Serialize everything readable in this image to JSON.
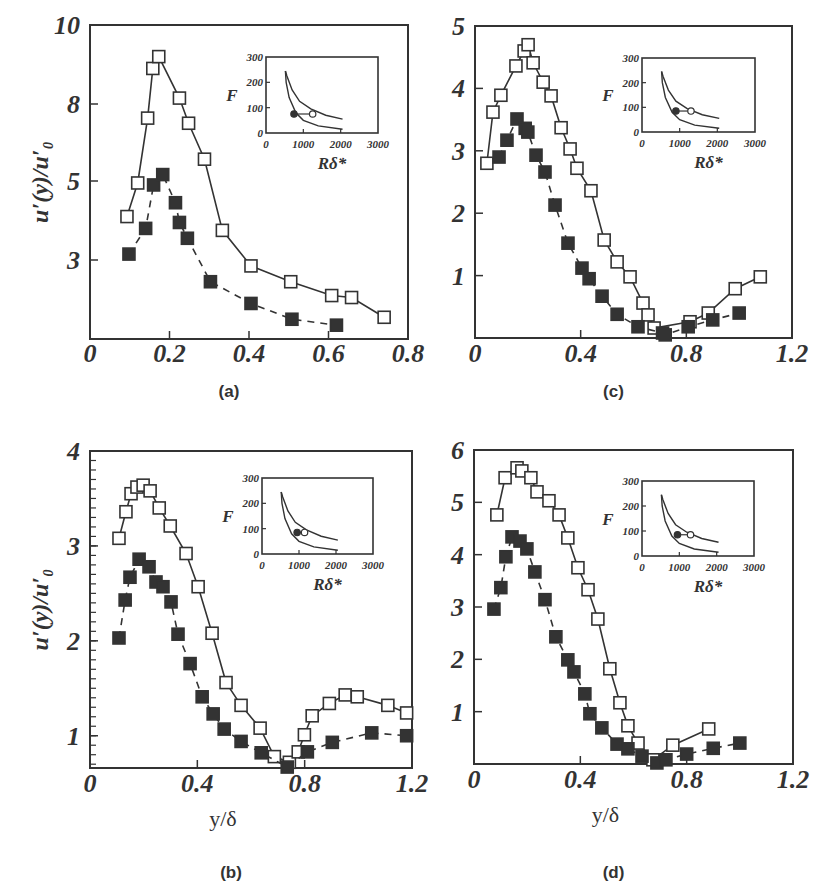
{
  "figure": {
    "y_axis_label": "u′(y)/u′₀",
    "x_axis_label": "y/δ",
    "inset_y_label": "F",
    "inset_x_label": "Rδ*",
    "colors": {
      "ink": "#333333",
      "background": "#ffffff"
    }
  },
  "chart_data": [
    {
      "panel": "a",
      "caption": "(a)",
      "type": "line",
      "xlabel": "",
      "ylabel": "u'(y)/u'0",
      "xlim": [
        0,
        0.8
      ],
      "x_ticks": [
        "0",
        "0.2",
        "0.4",
        "0.6",
        "0.8"
      ],
      "y_ticks": [
        "10",
        "8",
        "5",
        "3"
      ],
      "y_tick_px": [
        25,
        104,
        181,
        260
      ],
      "grid": false,
      "series": [
        {
          "name": "open squares (solid line)",
          "marker": "open-square",
          "line": "solid",
          "x": [
            0.093,
            0.12,
            0.145,
            0.158,
            0.173,
            0.225,
            0.248,
            0.288,
            0.333,
            0.405,
            0.505,
            0.608,
            0.658,
            0.74
          ],
          "y": [
            4.1,
            4.95,
            7.45,
            8.9,
            9.2,
            8.15,
            7.25,
            5.85,
            3.75,
            2.85,
            2.45,
            2.1,
            2.05,
            1.55
          ],
          "px_y": [
            218,
            183,
            121,
            76,
            67,
            99,
            127,
            157,
            239,
            267,
            281,
            293,
            295,
            309
          ]
        },
        {
          "name": "filled squares (dashed line)",
          "marker": "filled-square",
          "line": "dashed",
          "x": [
            0.098,
            0.14,
            0.16,
            0.183,
            0.215,
            0.225,
            0.245,
            0.303,
            0.405,
            0.508,
            0.62
          ],
          "y": [
            3.15,
            3.8,
            4.9,
            5.25,
            4.45,
            3.95,
            3.55,
            2.45,
            1.9,
            1.5,
            1.35
          ],
          "px_y": [
            255,
            231,
            185,
            173,
            200,
            223,
            240,
            281,
            298,
            311,
            316
          ]
        }
      ],
      "inset": {
        "xlabel": "Rδ*",
        "ylabel": "F",
        "xlim": [
          0,
          3000
        ],
        "ylim": [
          0,
          300
        ],
        "x_ticks": [
          "0",
          "1000",
          "2000",
          "3000"
        ],
        "y_ticks": [
          "0",
          "100",
          "200",
          "300"
        ],
        "markers": [
          {
            "type": "filled-circle",
            "R": 750,
            "F": 75
          },
          {
            "type": "open-circle",
            "R": 1250,
            "F": 75
          }
        ]
      }
    },
    {
      "panel": "b",
      "caption": "(b)",
      "type": "line",
      "xlabel": "y/δ",
      "ylabel": "u'(y)/u'0",
      "xlim": [
        0,
        1.2
      ],
      "ylim": [
        0.66,
        4
      ],
      "x_ticks": [
        "0",
        "0.4",
        "0.8",
        "1.2"
      ],
      "y_ticks": [
        "1",
        "2",
        "3",
        "4"
      ],
      "grid": false,
      "series": [
        {
          "name": "open squares (solid line)",
          "marker": "open-square",
          "line": "solid",
          "x": [
            0.108,
            0.134,
            0.153,
            0.175,
            0.198,
            0.224,
            0.258,
            0.299,
            0.358,
            0.403,
            0.455,
            0.507,
            0.563,
            0.634,
            0.687,
            0.743,
            0.776,
            0.799,
            0.828,
            0.892,
            0.951,
            0.996,
            1.11,
            1.18
          ],
          "y": [
            3.08,
            3.36,
            3.55,
            3.62,
            3.64,
            3.58,
            3.4,
            3.21,
            2.92,
            2.57,
            2.08,
            1.56,
            1.32,
            1.08,
            0.78,
            0.72,
            0.83,
            1.01,
            1.21,
            1.34,
            1.43,
            1.41,
            1.32,
            1.24
          ]
        },
        {
          "name": "filled squares (dashed line)",
          "marker": "filled-square",
          "line": "dashed",
          "x": [
            0.108,
            0.131,
            0.149,
            0.183,
            0.22,
            0.246,
            0.272,
            0.302,
            0.328,
            0.373,
            0.418,
            0.459,
            0.5,
            0.563,
            0.638,
            0.735,
            0.81,
            0.903,
            1.05,
            1.18
          ],
          "y": [
            2.03,
            2.43,
            2.67,
            2.86,
            2.78,
            2.62,
            2.57,
            2.41,
            2.07,
            1.76,
            1.41,
            1.23,
            1.07,
            0.94,
            0.82,
            0.67,
            0.83,
            0.93,
            1.03,
            1.0
          ]
        }
      ],
      "inset": {
        "xlabel": "Rδ*",
        "ylabel": "F",
        "xlim": [
          0,
          3000
        ],
        "ylim": [
          0,
          300
        ],
        "x_ticks": [
          "0",
          "1000",
          "2000",
          "3000"
        ],
        "y_ticks": [
          "0",
          "100",
          "200",
          "300"
        ],
        "markers": [
          {
            "type": "filled-circle",
            "R": 950,
            "F": 85
          },
          {
            "type": "open-circle",
            "R": 1150,
            "F": 85
          }
        ]
      }
    },
    {
      "panel": "c",
      "caption": "(c)",
      "type": "line",
      "xlabel": "",
      "ylabel": "",
      "xlim": [
        0,
        1.2
      ],
      "ylim": [
        0,
        5
      ],
      "x_ticks": [
        "0",
        "0.4",
        "0.8",
        "1.2"
      ],
      "y_ticks": [
        "1",
        "2",
        "3",
        "4",
        "5"
      ],
      "grid": false,
      "series": [
        {
          "name": "open squares (solid line)",
          "marker": "open-square",
          "line": "solid",
          "x": [
            0.045,
            0.068,
            0.098,
            0.155,
            0.186,
            0.201,
            0.22,
            0.258,
            0.288,
            0.326,
            0.36,
            0.386,
            0.439,
            0.489,
            0.538,
            0.587,
            0.636,
            0.655,
            0.678,
            0.814,
            0.883,
            0.985,
            1.08
          ],
          "y": [
            2.8,
            3.62,
            3.89,
            4.36,
            4.6,
            4.7,
            4.41,
            4.1,
            3.88,
            3.37,
            3.03,
            2.72,
            2.36,
            1.57,
            1.22,
            0.98,
            0.56,
            0.37,
            0.16,
            0.26,
            0.4,
            0.79,
            0.98
          ]
        },
        {
          "name": "filled squares (dashed line)",
          "marker": "filled-square",
          "line": "dashed",
          "x": [
            0.091,
            0.121,
            0.159,
            0.19,
            0.2,
            0.231,
            0.265,
            0.303,
            0.352,
            0.405,
            0.432,
            0.481,
            0.538,
            0.617,
            0.71,
            0.72,
            0.807,
            0.9,
            1.0
          ],
          "y": [
            2.9,
            3.17,
            3.51,
            3.36,
            3.3,
            2.93,
            2.66,
            2.13,
            1.52,
            1.12,
            0.95,
            0.67,
            0.38,
            0.18,
            0.08,
            0.05,
            0.18,
            0.29,
            0.4
          ]
        }
      ],
      "inset": {
        "xlabel": "Rδ*",
        "ylabel": "F",
        "xlim": [
          0,
          3000
        ],
        "ylim": [
          0,
          300
        ],
        "x_ticks": [
          "0",
          "1000",
          "2000",
          "3000"
        ],
        "y_ticks": [
          "0",
          "100",
          "200",
          "300"
        ],
        "markers": [
          {
            "type": "filled-circle",
            "R": 900,
            "F": 85
          },
          {
            "type": "open-circle",
            "R": 1300,
            "F": 85
          }
        ]
      }
    },
    {
      "panel": "d",
      "caption": "(d)",
      "type": "line",
      "xlabel": "y/δ",
      "ylabel": "",
      "xlim": [
        0,
        1.2
      ],
      "ylim": [
        0,
        6
      ],
      "x_ticks": [
        "0",
        "0.4",
        "0.8",
        "1.2"
      ],
      "y_ticks": [
        "1",
        "2",
        "3",
        "4",
        "5",
        "6"
      ],
      "grid": false,
      "series": [
        {
          "name": "open squares (solid line)",
          "marker": "open-square",
          "line": "solid",
          "x": [
            0.086,
            0.117,
            0.162,
            0.18,
            0.214,
            0.237,
            0.282,
            0.32,
            0.353,
            0.391,
            0.429,
            0.466,
            0.511,
            0.549,
            0.579,
            0.617,
            0.673,
            0.748,
            0.883
          ],
          "y": [
            4.76,
            5.47,
            5.66,
            5.6,
            5.47,
            5.2,
            5.03,
            4.76,
            4.32,
            3.75,
            3.33,
            2.77,
            1.82,
            1.17,
            0.73,
            0.4,
            0.08,
            0.36,
            0.67
          ]
        },
        {
          "name": "filled squares (dashed line)",
          "marker": "filled-square",
          "line": "dashed",
          "x": [
            0.075,
            0.101,
            0.12,
            0.143,
            0.173,
            0.199,
            0.229,
            0.267,
            0.308,
            0.353,
            0.376,
            0.417,
            0.436,
            0.481,
            0.538,
            0.579,
            0.632,
            0.688,
            0.722,
            0.8,
            0.9,
            1.0
          ],
          "y": [
            2.96,
            3.37,
            3.96,
            4.34,
            4.26,
            4.11,
            3.67,
            3.14,
            2.43,
            1.99,
            1.76,
            1.34,
            0.96,
            0.69,
            0.38,
            0.29,
            0.15,
            0.02,
            0.08,
            0.19,
            0.3,
            0.4
          ]
        }
      ],
      "inset": {
        "xlabel": "Rδ*",
        "ylabel": "F",
        "xlim": [
          0,
          3000
        ],
        "ylim": [
          0,
          300
        ],
        "x_ticks": [
          "0",
          "1000",
          "2000",
          "3000"
        ],
        "y_ticks": [
          "0",
          "100",
          "200",
          "300"
        ],
        "markers": [
          {
            "type": "filled-circle",
            "R": 950,
            "F": 85
          },
          {
            "type": "open-circle",
            "R": 1300,
            "F": 85
          }
        ]
      }
    }
  ]
}
